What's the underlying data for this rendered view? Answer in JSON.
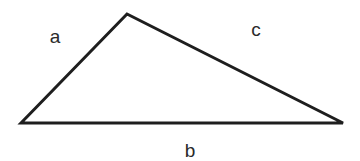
{
  "diagram": {
    "type": "triangle",
    "vertices": {
      "left": [
        21,
        123
      ],
      "top": [
        127,
        14
      ],
      "right": [
        343,
        123
      ]
    },
    "sides": [
      {
        "id": "a",
        "label": "a",
        "from": "left",
        "to": "top",
        "label_pos": [
          55,
          43
        ]
      },
      {
        "id": "c",
        "label": "c",
        "from": "top",
        "to": "right",
        "label_pos": [
          256,
          36
        ]
      },
      {
        "id": "b",
        "label": "b",
        "from": "left",
        "to": "right",
        "label_pos": [
          190,
          157
        ]
      }
    ],
    "stroke_color": "#1e1e1e",
    "label_color": "#2a2a2a"
  }
}
